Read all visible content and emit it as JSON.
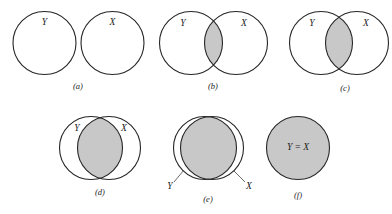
{
  "figure": {
    "background_color": "#ffffff",
    "stroke_color": "#262626",
    "shade_color": "#c8c8c8",
    "label_color": "#1b1b1b"
  },
  "panels": [
    {
      "id": "a",
      "caption": "(a)",
      "relation": "disjoint",
      "shaded": "none",
      "labels": {
        "left": "Y",
        "right": "X"
      },
      "leader_lines": false
    },
    {
      "id": "b",
      "caption": "(b)",
      "relation": "slight-overlap",
      "shaded": "intersection",
      "labels": {
        "left": "Y",
        "right": "X"
      },
      "leader_lines": false
    },
    {
      "id": "c",
      "caption": "(c)",
      "relation": "moderate-overlap",
      "shaded": "intersection",
      "labels": {
        "left": "Y",
        "right": "X"
      },
      "leader_lines": false
    },
    {
      "id": "d",
      "caption": "(d)",
      "relation": "large-overlap",
      "shaded": "intersection",
      "labels": {
        "left": "Y",
        "right": "X"
      },
      "leader_lines": false
    },
    {
      "id": "e",
      "caption": "(e)",
      "relation": "near-identical",
      "shaded": "intersection",
      "labels": {
        "left": "Y",
        "right": "X"
      },
      "leader_lines": true
    },
    {
      "id": "f",
      "caption": "(f)",
      "relation": "identical",
      "shaded": "full",
      "labels": {
        "equality": "Y = X"
      },
      "leader_lines": false
    }
  ]
}
